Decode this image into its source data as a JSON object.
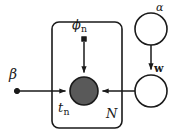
{
  "figure": {
    "kind": "plate-notation-graphical-model",
    "width": 177,
    "height": 140,
    "background_color": "#ffffff",
    "stroke_color": "#1a1a1a",
    "observed_node_fill": "#595959"
  },
  "nodes": {
    "beta": {
      "label": "β",
      "label_plain": "beta",
      "shape": "filled-dot",
      "role": "fixed-hyperparameter",
      "cx": 17,
      "cy": 90,
      "r": 2.6
    },
    "phi_n": {
      "label": "ϕ",
      "subscript": "n",
      "label_plain": "phi_n",
      "shape": "filled-square",
      "role": "fixed-parameter",
      "cx": 84,
      "cy": 39,
      "size": 4.4
    },
    "t_n": {
      "label": "t",
      "subscript": "n",
      "label_plain": "t_n",
      "shape": "shaded-circle",
      "role": "observed-variable",
      "cx": 84,
      "cy": 91,
      "r": 14,
      "fill": "#595959"
    },
    "alpha": {
      "label": "α",
      "label_plain": "alpha",
      "shape": "open-circle",
      "role": "latent-hyperparameter",
      "cx": 151,
      "cy": 29,
      "r": 16
    },
    "w": {
      "label": "w",
      "label_plain": "w",
      "shape": "open-circle",
      "role": "latent-variable",
      "bold": true,
      "cx": 151,
      "cy": 91,
      "r": 16
    }
  },
  "plate": {
    "label": "N",
    "x": 52,
    "y": 22,
    "width": 70,
    "height": 106,
    "corner_radius": 7
  },
  "edges": [
    {
      "from": "phi_n",
      "to": "t_n",
      "direction": "down",
      "arrow": true
    },
    {
      "from": "beta",
      "to": "t_n",
      "direction": "right",
      "arrow": true
    },
    {
      "from": "w",
      "to": "t_n",
      "direction": "left",
      "arrow": true
    },
    {
      "from": "alpha",
      "to": "w",
      "direction": "down",
      "arrow": true
    }
  ]
}
